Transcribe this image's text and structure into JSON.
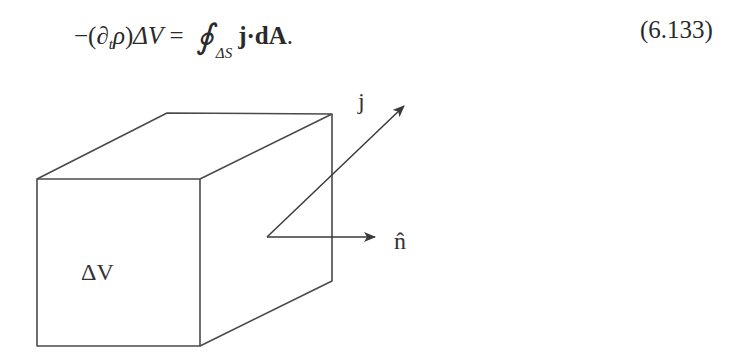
{
  "equation": {
    "lhs_minus": "−(",
    "partial": "∂",
    "partial_sub": "t",
    "rho": "ρ",
    "close_paren": ")",
    "delta_v": "ΔV",
    "equals": " = ",
    "integral": "∮",
    "integral_limit": "ΔS",
    "rhs": "j·dA",
    "period": ".",
    "number": "(6.133)"
  },
  "diagram": {
    "volume_label": "ΔV",
    "current_vector_label": "j",
    "normal_vector_label": "n̂",
    "stroke_color": "#4a4a4a"
  }
}
